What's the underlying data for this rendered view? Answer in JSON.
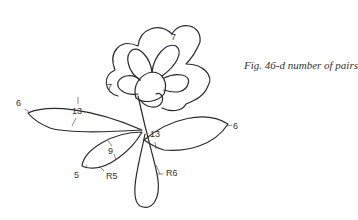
{
  "caption": "Fig. 46-d number of pairs",
  "labels": {
    "outer_petal_top": "7",
    "outer_petal_left": "7",
    "left_leaf_tip": "6",
    "left_leaf_width": "13",
    "right_leaf_tip": "6",
    "right_leaf_width": "13",
    "small_leaf_tip": "5",
    "small_leaf_width": "9",
    "small_leaf_radius": "R5",
    "stem_loop_radius": "R6"
  }
}
